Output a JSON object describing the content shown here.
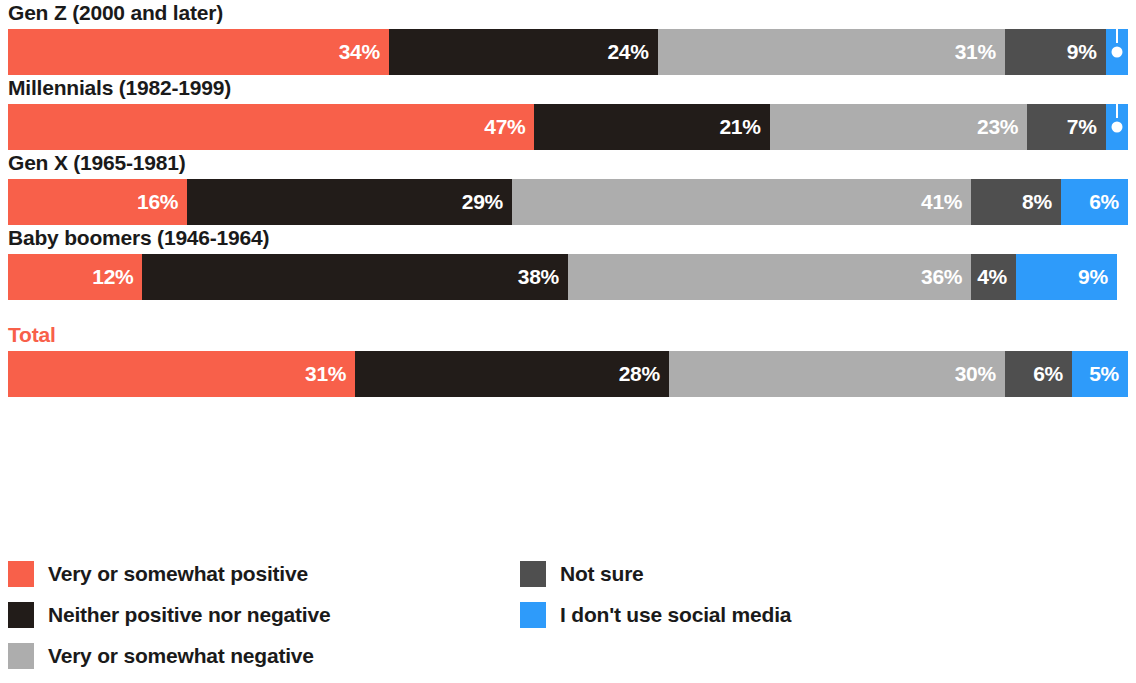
{
  "colors": {
    "positive": "#F8604A",
    "neutral": "#221C19",
    "negative": "#ADADAD",
    "not_sure": "#4F4F4F",
    "no_social": "#2E9BFA",
    "label_accent": "#F8604A",
    "label_dark": "#1a1a1a",
    "value_text": "#ffffff",
    "background": "#ffffff"
  },
  "legend": {
    "column_1": [
      {
        "label": "Very or somewhat positive",
        "color": "#F8604A",
        "key": "positive"
      },
      {
        "label": "Neither positive nor negative",
        "color": "#221C19",
        "key": "neutral"
      },
      {
        "label": "Very or somewhat negative",
        "color": "#ADADAD",
        "key": "negative"
      }
    ],
    "column_2": [
      {
        "label": "Not sure",
        "color": "#4F4F4F",
        "key": "not_sure"
      },
      {
        "label": "I don't use social media",
        "color": "#2E9BFA",
        "key": "no_social"
      }
    ]
  },
  "rows": [
    {
      "id": "gen-z",
      "label": "Gen Z (2000 and later)",
      "accent": false,
      "spaced": false,
      "segments": [
        {
          "key": "positive",
          "value": 34,
          "display": "34%",
          "color": "#F8604A",
          "callout": false
        },
        {
          "key": "neutral",
          "value": 24,
          "display": "24%",
          "color": "#221C19",
          "callout": false
        },
        {
          "key": "negative",
          "value": 31,
          "display": "31%",
          "color": "#ADADAD",
          "callout": false
        },
        {
          "key": "not_sure",
          "value": 9,
          "display": "9%",
          "color": "#4F4F4F",
          "callout": false
        },
        {
          "key": "no_social",
          "value": 2,
          "display": "2%",
          "color": "#2E9BFA",
          "callout": true
        }
      ]
    },
    {
      "id": "millennials",
      "label": "Millennials (1982-1999)",
      "accent": false,
      "spaced": false,
      "segments": [
        {
          "key": "positive",
          "value": 47,
          "display": "47%",
          "color": "#F8604A",
          "callout": false
        },
        {
          "key": "neutral",
          "value": 21,
          "display": "21%",
          "color": "#221C19",
          "callout": false
        },
        {
          "key": "negative",
          "value": 23,
          "display": "23%",
          "color": "#ADADAD",
          "callout": false
        },
        {
          "key": "not_sure",
          "value": 7,
          "display": "7%",
          "color": "#4F4F4F",
          "callout": false
        },
        {
          "key": "no_social",
          "value": 2,
          "display": "2%",
          "color": "#2E9BFA",
          "callout": true
        }
      ]
    },
    {
      "id": "gen-x",
      "label": "Gen X (1965-1981)",
      "accent": false,
      "spaced": false,
      "segments": [
        {
          "key": "positive",
          "value": 16,
          "display": "16%",
          "color": "#F8604A",
          "callout": false
        },
        {
          "key": "neutral",
          "value": 29,
          "display": "29%",
          "color": "#221C19",
          "callout": false
        },
        {
          "key": "negative",
          "value": 41,
          "display": "41%",
          "color": "#ADADAD",
          "callout": false
        },
        {
          "key": "not_sure",
          "value": 8,
          "display": "8%",
          "color": "#4F4F4F",
          "callout": false
        },
        {
          "key": "no_social",
          "value": 6,
          "display": "6%",
          "color": "#2E9BFA",
          "callout": false
        }
      ]
    },
    {
      "id": "baby-boomers",
      "label": "Baby boomers (1946-1964)",
      "accent": false,
      "spaced": false,
      "segments": [
        {
          "key": "positive",
          "value": 12,
          "display": "12%",
          "color": "#F8604A",
          "callout": false
        },
        {
          "key": "neutral",
          "value": 38,
          "display": "38%",
          "color": "#221C19",
          "callout": false
        },
        {
          "key": "negative",
          "value": 36,
          "display": "36%",
          "color": "#ADADAD",
          "callout": false
        },
        {
          "key": "not_sure",
          "value": 4,
          "display": "4%",
          "color": "#4F4F4F",
          "callout": false
        },
        {
          "key": "no_social",
          "value": 9,
          "display": "9%",
          "color": "#2E9BFA",
          "callout": false
        }
      ]
    },
    {
      "id": "total",
      "label": "Total",
      "accent": true,
      "spaced": true,
      "segments": [
        {
          "key": "positive",
          "value": 31,
          "display": "31%",
          "color": "#F8604A",
          "callout": false
        },
        {
          "key": "neutral",
          "value": 28,
          "display": "28%",
          "color": "#221C19",
          "callout": false
        },
        {
          "key": "negative",
          "value": 30,
          "display": "30%",
          "color": "#ADADAD",
          "callout": false
        },
        {
          "key": "not_sure",
          "value": 6,
          "display": "6%",
          "color": "#4F4F4F",
          "callout": false
        },
        {
          "key": "no_social",
          "value": 5,
          "display": "5%",
          "color": "#2E9BFA",
          "callout": false
        }
      ]
    }
  ],
  "chart_data": {
    "type": "bar",
    "orientation": "horizontal",
    "stacked": true,
    "normalized_to": 100,
    "title": "",
    "subtitle": "",
    "xlabel": "",
    "ylabel": "",
    "xlim": [
      0,
      100
    ],
    "grid": false,
    "legend_position": "bottom",
    "categories": [
      "Gen Z (2000 and later)",
      "Millennials (1982-1999)",
      "Gen X (1965-1981)",
      "Baby boomers (1946-1964)",
      "Total"
    ],
    "series": [
      {
        "name": "Very or somewhat positive",
        "color": "#F8604A",
        "values": [
          34,
          47,
          16,
          12,
          31
        ]
      },
      {
        "name": "Neither positive nor negative",
        "color": "#221C19",
        "values": [
          24,
          21,
          29,
          38,
          28
        ]
      },
      {
        "name": "Very or somewhat negative",
        "color": "#ADADAD",
        "values": [
          31,
          23,
          41,
          36,
          30
        ]
      },
      {
        "name": "Not sure",
        "color": "#4F4F4F",
        "values": [
          9,
          7,
          8,
          4,
          6
        ]
      },
      {
        "name": "I don't use social media",
        "color": "#2E9BFA",
        "values": [
          2,
          2,
          6,
          9,
          5
        ]
      }
    ],
    "data_labels": [
      [
        "34%",
        "24%",
        "31%",
        "9%",
        "2%"
      ],
      [
        "47%",
        "21%",
        "23%",
        "7%",
        "2%"
      ],
      [
        "16%",
        "29%",
        "41%",
        "8%",
        "6%"
      ],
      [
        "12%",
        "38%",
        "36%",
        "4%",
        "9%"
      ],
      [
        "31%",
        "28%",
        "30%",
        "6%",
        "5%"
      ]
    ],
    "annotations": [
      {
        "category": "Gen Z (2000 and later)",
        "series": "I don't use social media",
        "text": "2%",
        "style": "leader-line-callout"
      },
      {
        "category": "Millennials (1982-1999)",
        "series": "I don't use social media",
        "text": "2%",
        "style": "leader-line-callout"
      }
    ]
  }
}
